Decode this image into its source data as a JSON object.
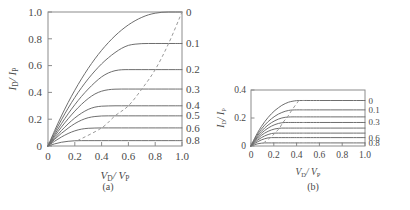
{
  "figure": {
    "caption_sliver": "",
    "panels": [
      {
        "id": "a",
        "caption": "(a)",
        "xlabel_main": "V",
        "xlabel_sub": "D",
        "xlabel_main2": "/ V",
        "xlabel_sub2": "P",
        "ylabel_main": "I",
        "ylabel_sub": "D",
        "ylabel_main2": "/ I",
        "ylabel_sub2": "P"
      },
      {
        "id": "b",
        "caption": "(b)",
        "xlabel_main": "V",
        "xlabel_sub": "D",
        "xlabel_main2": "/ V",
        "xlabel_sub2": "P",
        "ylabel_main": "I",
        "ylabel_sub": "D",
        "ylabel_main2": "/ I",
        "ylabel_sub2": "P"
      }
    ]
  },
  "chart_data": [
    {
      "panel": "a",
      "type": "line",
      "title": "",
      "subtitle": "(a)",
      "xlabel": "V_D / V_P",
      "ylabel": "I_D / I_P",
      "xlim": [
        0,
        1.0
      ],
      "ylim": [
        0,
        1.0
      ],
      "xticks": [
        0,
        0.2,
        0.4,
        0.6,
        0.8,
        1.0
      ],
      "xticklabels": [
        "0",
        "0.2",
        "0.4",
        "0.6",
        "0.8",
        "1.0"
      ],
      "yticks": [
        0,
        0.2,
        0.4,
        0.6,
        0.8,
        1.0
      ],
      "yticklabels": [
        "0",
        "0.2",
        "0.4",
        "0.6",
        "0.8",
        "1.0"
      ],
      "grid": false,
      "legend_position": "right-edge-inline",
      "right_axis_labels": [
        "0",
        "0.1",
        "0.2",
        "0.3",
        "0.4",
        "0.5",
        "0.6",
        "0.8"
      ],
      "series": [
        {
          "name": "0",
          "gate_bias": 0.0,
          "saturation_value": 1.0,
          "knee_x": 1.0,
          "x": [
            0,
            0.05,
            0.1,
            0.15,
            0.2,
            0.25,
            0.3,
            0.35,
            0.4,
            0.45,
            0.5,
            0.55,
            0.6,
            0.65,
            0.7,
            0.75,
            0.8,
            0.85,
            0.9,
            0.95,
            1.0
          ],
          "y": [
            0,
            0.116,
            0.224,
            0.324,
            0.416,
            0.501,
            0.579,
            0.65,
            0.714,
            0.771,
            0.822,
            0.866,
            0.904,
            0.935,
            0.96,
            0.979,
            0.991,
            0.998,
            1.0,
            1.0,
            1.0
          ]
        },
        {
          "name": "0.1",
          "gate_bias": 0.1,
          "saturation_value": 0.765,
          "knee_x": 0.9,
          "x": [
            0,
            0.05,
            0.1,
            0.15,
            0.2,
            0.25,
            0.3,
            0.35,
            0.4,
            0.45,
            0.5,
            0.55,
            0.6,
            0.65,
            0.7,
            0.75,
            0.8,
            0.85,
            0.9,
            0.95,
            1.0
          ],
          "y": [
            0,
            0.101,
            0.195,
            0.282,
            0.362,
            0.435,
            0.501,
            0.56,
            0.613,
            0.658,
            0.697,
            0.729,
            0.751,
            0.76,
            0.764,
            0.765,
            0.765,
            0.765,
            0.765,
            0.765,
            0.765
          ]
        },
        {
          "name": "0.2",
          "gate_bias": 0.2,
          "saturation_value": 0.57,
          "knee_x": 0.8,
          "x": [
            0,
            0.05,
            0.1,
            0.15,
            0.2,
            0.25,
            0.3,
            0.35,
            0.4,
            0.45,
            0.5,
            0.55,
            0.6,
            0.65,
            0.7,
            0.75,
            0.8,
            0.85,
            0.9,
            0.95,
            1.0
          ],
          "y": [
            0,
            0.086,
            0.166,
            0.24,
            0.308,
            0.37,
            0.425,
            0.474,
            0.516,
            0.545,
            0.562,
            0.569,
            0.57,
            0.57,
            0.57,
            0.57,
            0.57,
            0.57,
            0.57,
            0.57,
            0.57
          ]
        },
        {
          "name": "0.3",
          "gate_bias": 0.3,
          "saturation_value": 0.425,
          "knee_x": 0.7,
          "x": [
            0,
            0.05,
            0.1,
            0.15,
            0.2,
            0.25,
            0.3,
            0.35,
            0.4,
            0.45,
            0.5,
            0.55,
            0.6,
            0.65,
            0.7,
            0.75,
            0.8,
            0.85,
            0.9,
            0.95,
            1.0
          ],
          "y": [
            0,
            0.073,
            0.141,
            0.203,
            0.26,
            0.311,
            0.354,
            0.388,
            0.409,
            0.42,
            0.424,
            0.425,
            0.425,
            0.425,
            0.425,
            0.425,
            0.425,
            0.425,
            0.425,
            0.425,
            0.425
          ]
        },
        {
          "name": "0.4",
          "gate_bias": 0.4,
          "saturation_value": 0.3,
          "knee_x": 0.6,
          "x": [
            0,
            0.05,
            0.1,
            0.15,
            0.2,
            0.25,
            0.3,
            0.35,
            0.4,
            0.45,
            0.5,
            0.55,
            0.6,
            0.65,
            0.7,
            0.75,
            0.8,
            0.85,
            0.9,
            0.95,
            1.0
          ],
          "y": [
            0,
            0.06,
            0.115,
            0.165,
            0.209,
            0.245,
            0.273,
            0.29,
            0.297,
            0.299,
            0.3,
            0.3,
            0.3,
            0.3,
            0.3,
            0.3,
            0.3,
            0.3,
            0.3,
            0.3,
            0.3
          ]
        },
        {
          "name": "0.5",
          "gate_bias": 0.5,
          "saturation_value": 0.225,
          "knee_x": 0.5,
          "x": [
            0,
            0.05,
            0.1,
            0.15,
            0.2,
            0.25,
            0.3,
            0.35,
            0.4,
            0.45,
            0.5,
            0.55,
            0.6,
            0.65,
            0.7,
            0.75,
            0.8,
            0.85,
            0.9,
            0.95,
            1.0
          ],
          "y": [
            0,
            0.05,
            0.094,
            0.133,
            0.167,
            0.193,
            0.211,
            0.22,
            0.224,
            0.225,
            0.225,
            0.225,
            0.225,
            0.225,
            0.225,
            0.225,
            0.225,
            0.225,
            0.225,
            0.225,
            0.225
          ]
        },
        {
          "name": "0.6",
          "gate_bias": 0.6,
          "saturation_value": 0.135,
          "knee_x": 0.4,
          "x": [
            0,
            0.05,
            0.1,
            0.15,
            0.2,
            0.25,
            0.3,
            0.35,
            0.4,
            0.45,
            0.5,
            0.55,
            0.6,
            0.65,
            0.7,
            0.75,
            0.8,
            0.85,
            0.9,
            0.95,
            1.0
          ],
          "y": [
            0,
            0.036,
            0.067,
            0.093,
            0.113,
            0.126,
            0.132,
            0.134,
            0.135,
            0.135,
            0.135,
            0.135,
            0.135,
            0.135,
            0.135,
            0.135,
            0.135,
            0.135,
            0.135,
            0.135,
            0.135
          ]
        },
        {
          "name": "0.8",
          "gate_bias": 0.8,
          "saturation_value": 0.04,
          "knee_x": 0.22,
          "x": [
            0,
            0.05,
            0.1,
            0.15,
            0.2,
            0.25,
            0.3,
            0.35,
            0.4,
            0.45,
            0.5,
            0.55,
            0.6,
            0.65,
            0.7,
            0.75,
            0.8,
            0.85,
            0.9,
            0.95,
            1.0
          ],
          "y": [
            0,
            0.016,
            0.028,
            0.035,
            0.039,
            0.04,
            0.04,
            0.04,
            0.04,
            0.04,
            0.04,
            0.04,
            0.04,
            0.04,
            0.04,
            0.04,
            0.04,
            0.04,
            0.04,
            0.04,
            0.04
          ]
        }
      ],
      "annotations": [
        {
          "name": "saturation-locus",
          "style": "dashed",
          "x": [
            0.22,
            0.4,
            0.5,
            0.6,
            0.7,
            0.8,
            0.9,
            1.0
          ],
          "y": [
            0.04,
            0.135,
            0.225,
            0.3,
            0.425,
            0.57,
            0.765,
            1.0
          ]
        }
      ]
    },
    {
      "panel": "b",
      "type": "line",
      "title": "",
      "subtitle": "(b)",
      "xlabel": "V_D / V_P",
      "ylabel": "I_D / I_P",
      "xlim": [
        0,
        1.0
      ],
      "ylim": [
        0,
        0.4
      ],
      "xticks": [
        0,
        0.2,
        0.4,
        0.6,
        0.8,
        1.0
      ],
      "xticklabels": [
        "0",
        "0.2",
        "0.4",
        "0.6",
        "0.8",
        "1.0"
      ],
      "yticks": [
        0,
        0.2,
        0.4
      ],
      "yticklabels": [
        "0",
        "0.2",
        "0.4"
      ],
      "grid": false,
      "legend_position": "right-edge-inline",
      "right_axis_labels": [
        "0",
        "0.1",
        "0.3",
        "0.6",
        "0.8"
      ],
      "series": [
        {
          "name": "0",
          "gate_bias": 0.0,
          "saturation_value": 0.325,
          "knee_x": 0.42,
          "x": [
            0,
            0.03,
            0.06,
            0.09,
            0.12,
            0.15,
            0.18,
            0.21,
            0.24,
            0.27,
            0.3,
            0.33,
            0.36,
            0.4,
            0.45,
            0.5,
            0.6,
            0.7,
            0.8,
            0.9,
            1.0
          ],
          "y": [
            0,
            0.052,
            0.098,
            0.138,
            0.173,
            0.204,
            0.231,
            0.254,
            0.273,
            0.29,
            0.303,
            0.313,
            0.319,
            0.324,
            0.325,
            0.325,
            0.325,
            0.325,
            0.325,
            0.325,
            0.325
          ]
        },
        {
          "name": "0.1",
          "gate_bias": 0.1,
          "saturation_value": 0.258,
          "knee_x": 0.36,
          "x": [
            0,
            0.03,
            0.06,
            0.09,
            0.12,
            0.15,
            0.18,
            0.21,
            0.24,
            0.27,
            0.3,
            0.33,
            0.36,
            0.4,
            0.45,
            0.5,
            0.6,
            0.7,
            0.8,
            0.9,
            1.0
          ],
          "y": [
            0,
            0.046,
            0.086,
            0.12,
            0.149,
            0.174,
            0.195,
            0.213,
            0.228,
            0.239,
            0.248,
            0.254,
            0.257,
            0.258,
            0.258,
            0.258,
            0.258,
            0.258,
            0.258,
            0.258,
            0.258
          ]
        },
        {
          "name": "0.2",
          "gate_bias": 0.2,
          "saturation_value": 0.208,
          "knee_x": 0.32,
          "x": [
            0,
            0.03,
            0.06,
            0.09,
            0.12,
            0.15,
            0.18,
            0.21,
            0.24,
            0.27,
            0.3,
            0.33,
            0.36,
            0.4,
            0.45,
            0.5,
            0.6,
            0.7,
            0.8,
            0.9,
            1.0
          ],
          "y": [
            0,
            0.04,
            0.075,
            0.104,
            0.129,
            0.15,
            0.167,
            0.181,
            0.192,
            0.2,
            0.205,
            0.207,
            0.208,
            0.208,
            0.208,
            0.208,
            0.208,
            0.208,
            0.208,
            0.208,
            0.208
          ]
        },
        {
          "name": "0.3",
          "gate_bias": 0.3,
          "saturation_value": 0.168,
          "knee_x": 0.28,
          "x": [
            0,
            0.03,
            0.06,
            0.09,
            0.12,
            0.15,
            0.18,
            0.21,
            0.24,
            0.27,
            0.3,
            0.33,
            0.36,
            0.4,
            0.45,
            0.5,
            0.6,
            0.7,
            0.8,
            0.9,
            1.0
          ],
          "y": [
            0,
            0.035,
            0.065,
            0.09,
            0.111,
            0.128,
            0.142,
            0.153,
            0.161,
            0.166,
            0.168,
            0.168,
            0.168,
            0.168,
            0.168,
            0.168,
            0.168,
            0.168,
            0.168,
            0.168,
            0.168
          ]
        },
        {
          "name": "0.4",
          "gate_bias": 0.4,
          "saturation_value": 0.128,
          "knee_x": 0.25,
          "x": [
            0,
            0.03,
            0.06,
            0.09,
            0.12,
            0.15,
            0.18,
            0.21,
            0.24,
            0.27,
            0.3,
            0.33,
            0.36,
            0.4,
            0.45,
            0.5,
            0.6,
            0.7,
            0.8,
            0.9,
            1.0
          ],
          "y": [
            0,
            0.029,
            0.054,
            0.075,
            0.092,
            0.105,
            0.115,
            0.122,
            0.126,
            0.128,
            0.128,
            0.128,
            0.128,
            0.128,
            0.128,
            0.128,
            0.128,
            0.128,
            0.128,
            0.128,
            0.128
          ]
        },
        {
          "name": "0.5",
          "gate_bias": 0.5,
          "saturation_value": 0.092,
          "knee_x": 0.21,
          "x": [
            0,
            0.03,
            0.06,
            0.09,
            0.12,
            0.15,
            0.18,
            0.21,
            0.24,
            0.27,
            0.3,
            0.33,
            0.36,
            0.4,
            0.45,
            0.5,
            0.6,
            0.7,
            0.8,
            0.9,
            1.0
          ],
          "y": [
            0,
            0.023,
            0.043,
            0.059,
            0.072,
            0.082,
            0.089,
            0.092,
            0.092,
            0.092,
            0.092,
            0.092,
            0.092,
            0.092,
            0.092,
            0.092,
            0.092,
            0.092,
            0.092,
            0.092,
            0.092
          ]
        },
        {
          "name": "0.6",
          "gate_bias": 0.6,
          "saturation_value": 0.06,
          "knee_x": 0.17,
          "x": [
            0,
            0.03,
            0.06,
            0.09,
            0.12,
            0.15,
            0.18,
            0.21,
            0.24,
            0.27,
            0.3,
            0.33,
            0.36,
            0.4,
            0.45,
            0.5,
            0.6,
            0.7,
            0.8,
            0.9,
            1.0
          ],
          "y": [
            0,
            0.017,
            0.031,
            0.043,
            0.052,
            0.058,
            0.06,
            0.06,
            0.06,
            0.06,
            0.06,
            0.06,
            0.06,
            0.06,
            0.06,
            0.06,
            0.06,
            0.06,
            0.06,
            0.06,
            0.06
          ]
        },
        {
          "name": "0.8",
          "gate_bias": 0.8,
          "saturation_value": 0.022,
          "knee_x": 0.11,
          "x": [
            0,
            0.03,
            0.06,
            0.09,
            0.12,
            0.15,
            0.18,
            0.21,
            0.24,
            0.27,
            0.3,
            0.33,
            0.36,
            0.4,
            0.45,
            0.5,
            0.6,
            0.7,
            0.8,
            0.9,
            1.0
          ],
          "y": [
            0,
            0.009,
            0.016,
            0.02,
            0.022,
            0.022,
            0.022,
            0.022,
            0.022,
            0.022,
            0.022,
            0.022,
            0.022,
            0.022,
            0.022,
            0.022,
            0.022,
            0.022,
            0.022,
            0.022,
            0.022
          ]
        }
      ],
      "annotations": [
        {
          "name": "saturation-locus",
          "style": "dashed",
          "x": [
            0.11,
            0.17,
            0.21,
            0.25,
            0.28,
            0.32,
            0.36,
            0.42
          ],
          "y": [
            0.022,
            0.06,
            0.092,
            0.128,
            0.168,
            0.208,
            0.258,
            0.325
          ]
        }
      ]
    }
  ]
}
